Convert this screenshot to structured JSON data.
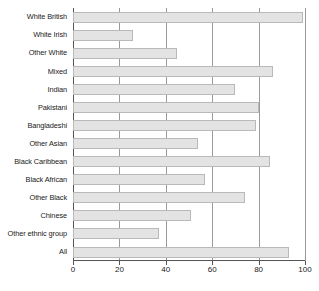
{
  "chart_data": {
    "type": "bar",
    "orientation": "horizontal",
    "title": "",
    "subtitle": "",
    "xlabel": "",
    "ylabel": "",
    "xlim": [
      0,
      100
    ],
    "ylim": null,
    "grid": true,
    "legend": null,
    "xticks": [
      0,
      20,
      40,
      60,
      80,
      100
    ],
    "xtick_labels": [
      "0",
      "20",
      "40",
      "60",
      "80",
      "100"
    ],
    "categories": [
      "White British",
      "White Irish",
      "Other White",
      "Mixed",
      "Indian",
      "Pakistani",
      "Bangladeshi",
      "Other Asian",
      "Black Caribbean",
      "Black African",
      "Other Black",
      "Chinese",
      "Other ethnic group",
      "All"
    ],
    "values": [
      99,
      26,
      45,
      86,
      70,
      80,
      79,
      54,
      85,
      57,
      74,
      51,
      37,
      93
    ],
    "bar_color": "#e3e3e3",
    "bar_border_color": "#b9b9b9",
    "axis_color": "#555555",
    "gridline_color": "#9a9a9a"
  }
}
